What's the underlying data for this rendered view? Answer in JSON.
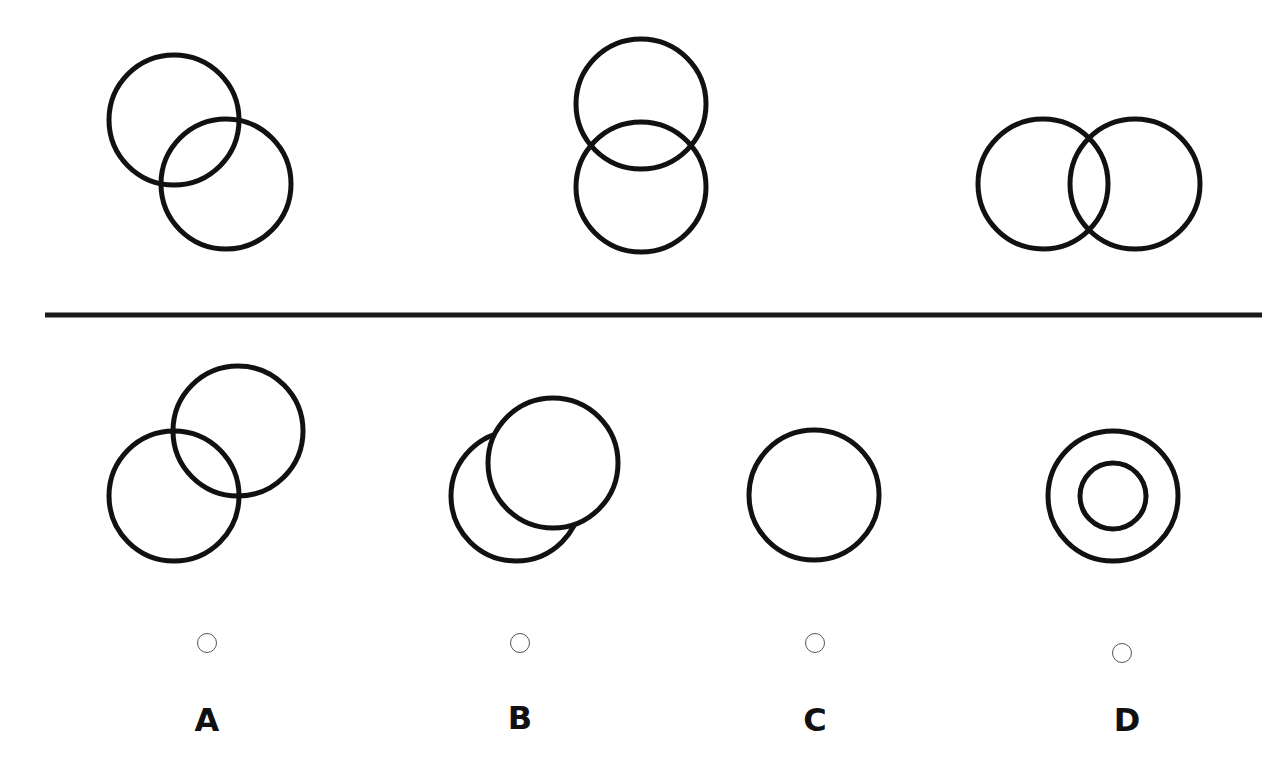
{
  "puzzle": {
    "question_figures": [
      {
        "id": "q1",
        "description": "two overlapping circles, diagonal (top-left to bottom-right)"
      },
      {
        "id": "q2",
        "description": "two overlapping circles, vertical"
      },
      {
        "id": "q3",
        "description": "two overlapping circles, horizontal"
      }
    ],
    "options": [
      {
        "label": "A",
        "description": "two overlapping circles, diagonal (bottom-left to top-right)",
        "selected": false
      },
      {
        "label": "B",
        "description": "one circle in front partially covering another circle",
        "selected": false
      },
      {
        "label": "C",
        "description": "single circle",
        "selected": false
      },
      {
        "label": "D",
        "description": "two concentric circles",
        "selected": false
      }
    ]
  },
  "colors": {
    "stroke": "#111111",
    "background": "#ffffff",
    "radio_border": "#555555"
  }
}
